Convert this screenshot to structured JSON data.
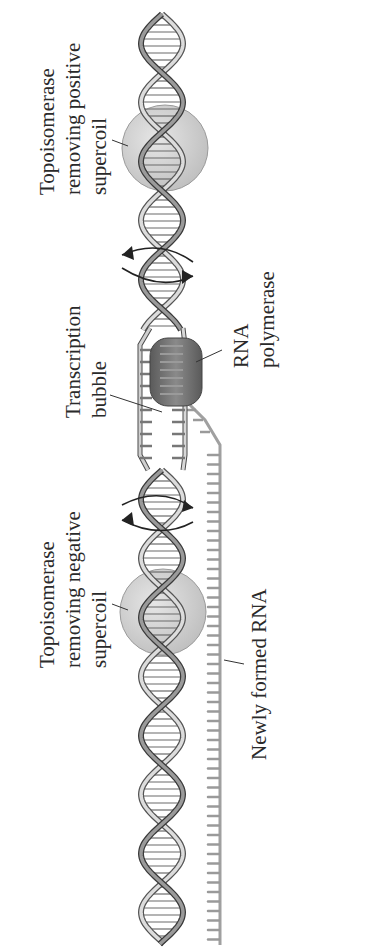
{
  "figure": {
    "orientation": "rotated -90deg (labels read bottom to top)"
  },
  "labels": {
    "topo_positive": {
      "lines": [
        "Topoisomerase",
        "removing positive",
        "supercoil"
      ]
    },
    "topo_negative": {
      "lines": [
        "Topoisomerase",
        "removing negative",
        "supercoil"
      ]
    },
    "bubble": {
      "lines": [
        "Transcription",
        "bubble"
      ]
    },
    "polymerase": {
      "lines": [
        "RNA",
        "polymerase"
      ]
    },
    "rna": {
      "lines": [
        "Newly formed RNA"
      ]
    }
  },
  "colors": {
    "background": "#ffffff",
    "text": "#2a2a2a",
    "topoisomerase": "#d4d4d4",
    "polymerase": "#707070",
    "helix_light": "#c8c8c8",
    "helix_dark": "#3a3a3a",
    "rna": "#a8a8a8"
  }
}
